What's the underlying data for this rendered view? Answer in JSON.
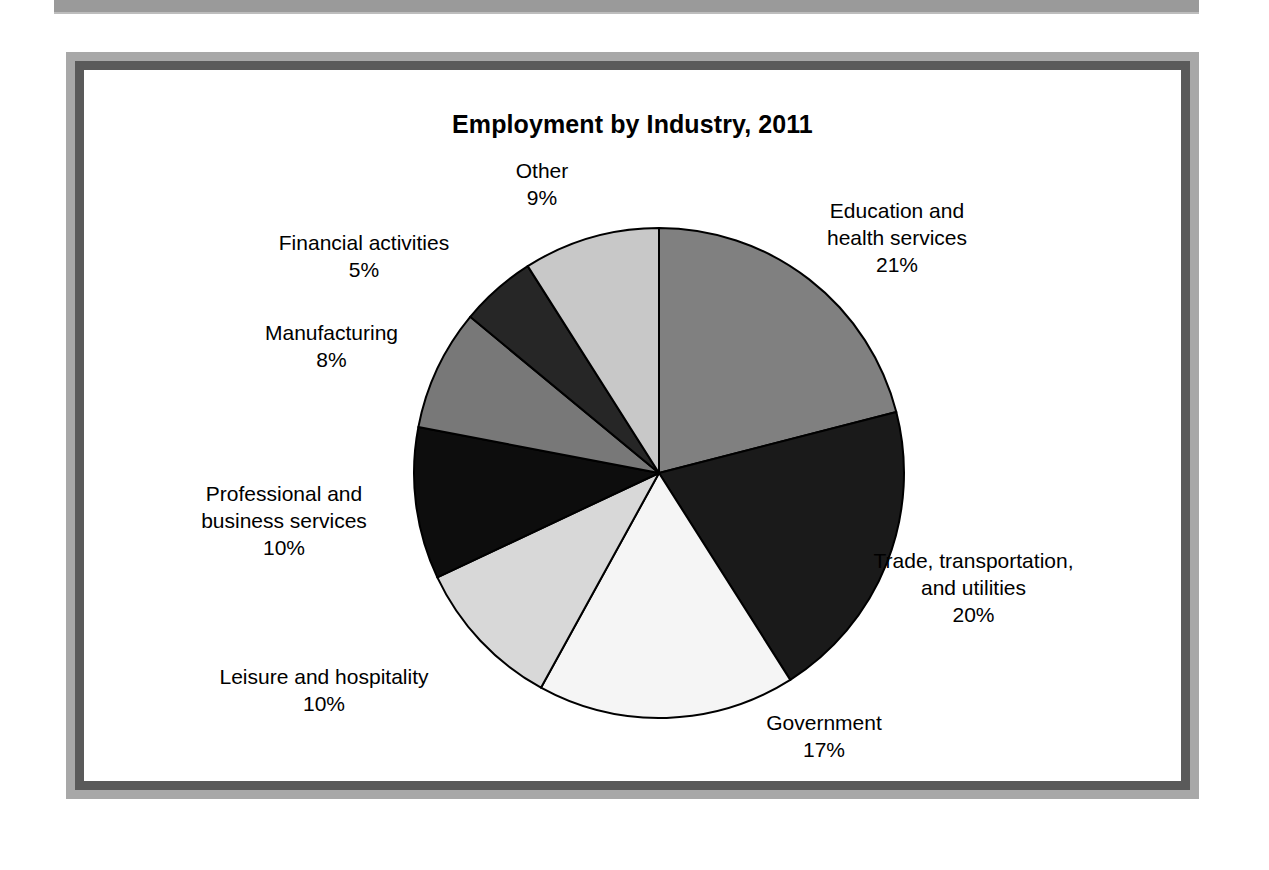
{
  "page": {
    "background_color": "#ffffff",
    "scan_strip_color": "#9a9a9a",
    "frame_outer_color": "#a8a8a8",
    "frame_inner_color": "#5a5a5a"
  },
  "chart_data": {
    "type": "pie",
    "title": "Employment by Industry, 2011",
    "xlabel": "",
    "ylabel": "",
    "legend_position": "none",
    "grid": false,
    "labels_outside": true,
    "start_angle_deg": 0,
    "direction": "clockwise",
    "units": "percent",
    "categories": [
      "Education and health services",
      "Trade, transportation, and utilities",
      "Government",
      "Leisure and hospitality",
      "Professional and business services",
      "Manufacturing",
      "Financial activities",
      "Other"
    ],
    "values": [
      21,
      20,
      17,
      10,
      10,
      8,
      5,
      9
    ],
    "colors": [
      "#808080",
      "#1a1a1a",
      "#f5f5f5",
      "#d8d8d8",
      "#0d0d0d",
      "#787878",
      "#262626",
      "#c8c8c8"
    ],
    "slice_outline_color": "#000000",
    "slices": [
      {
        "name": "Education and health services",
        "label_line_1": "Education and",
        "label_line_2": "health services",
        "value": 21,
        "percent_text": "21%",
        "color": "#808080"
      },
      {
        "name": "Trade, transportation, and utilities",
        "label_line_1": "Trade, transportation,",
        "label_line_2": "and utilities",
        "value": 20,
        "percent_text": "20%",
        "color": "#1a1a1a"
      },
      {
        "name": "Government",
        "label_line_1": "Government",
        "label_line_2": "",
        "value": 17,
        "percent_text": "17%",
        "color": "#f5f5f5"
      },
      {
        "name": "Leisure and hospitality",
        "label_line_1": "Leisure and hospitality",
        "label_line_2": "",
        "value": 10,
        "percent_text": "10%",
        "color": "#d8d8d8"
      },
      {
        "name": "Professional and business services",
        "label_line_1": "Professional and",
        "label_line_2": "business services",
        "value": 10,
        "percent_text": "10%",
        "color": "#0d0d0d"
      },
      {
        "name": "Manufacturing",
        "label_line_1": "Manufacturing",
        "label_line_2": "",
        "value": 8,
        "percent_text": "8%",
        "color": "#787878"
      },
      {
        "name": "Financial activities",
        "label_line_1": "Financial activities",
        "label_line_2": "",
        "value": 5,
        "percent_text": "5%",
        "color": "#262626"
      },
      {
        "name": "Other",
        "label_line_1": "Other",
        "label_line_2": "",
        "value": 9,
        "percent_text": "9%",
        "color": "#c8c8c8"
      }
    ]
  }
}
